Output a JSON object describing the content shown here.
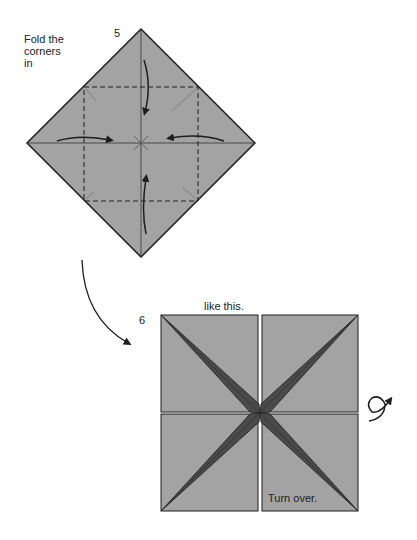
{
  "step5": {
    "number": "5",
    "instruction_lines": [
      "Fold the",
      "corners",
      "in"
    ]
  },
  "step6": {
    "number": "6",
    "caption": "like this.",
    "turn_over": "Turn over."
  },
  "colors": {
    "paper": "#a3a3a3",
    "paper_dark": "#4a4a4a",
    "line": "#1e1e1e",
    "background": "#ffffff"
  }
}
